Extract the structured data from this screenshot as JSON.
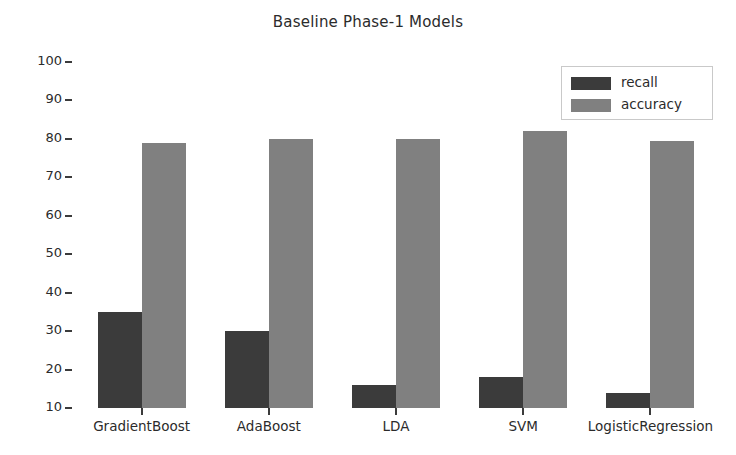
{
  "chart_data": {
    "type": "bar",
    "title": "Baseline Phase-1 Models",
    "xlabel": "",
    "ylabel": "",
    "categories": [
      "GradientBoost",
      "AdaBoost",
      "LDA",
      "SVM",
      "LogisticRegression"
    ],
    "series": [
      {
        "name": "recall",
        "color": "#3b3b3b",
        "values": [
          35,
          30,
          16,
          18,
          14
        ]
      },
      {
        "name": "accuracy",
        "color": "#808080",
        "values": [
          79,
          80,
          80,
          82,
          79.5
        ]
      }
    ],
    "ylim": [
      10,
      100
    ],
    "yticks": [
      100,
      90,
      80,
      70,
      60,
      50,
      40,
      30,
      20,
      10
    ],
    "ytick_labels": [
      "100",
      "90",
      "80",
      "70",
      "60",
      "50",
      "40",
      "30",
      "20",
      "10"
    ],
    "xtick_labels": [
      "GradientBoost",
      "AdaBoost",
      "LDA",
      "SVM",
      "LogisticRegression"
    ],
    "grid": false,
    "legend_position": "upper right",
    "legend_entries": [
      "recall",
      "accuracy"
    ],
    "background_color": "#ffffff",
    "text_color": "#2b2b2b"
  }
}
